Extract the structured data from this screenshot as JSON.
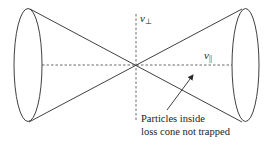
{
  "diagram": {
    "axes": {
      "perpendicular": {
        "symbol": "v",
        "subscript": "⊥"
      },
      "parallel": {
        "symbol": "v",
        "subscript": "||"
      }
    },
    "annotation": {
      "line1": "Particles inside",
      "line2": "loss cone not trapped"
    }
  }
}
